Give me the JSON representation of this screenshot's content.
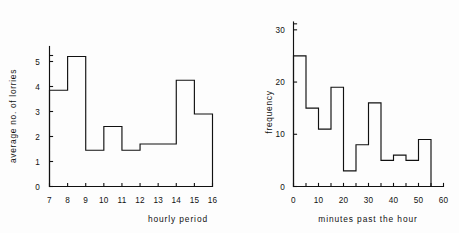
{
  "figure": {
    "background_color": "#fdfdfd",
    "ink_color": "#111111",
    "panel_count": 2
  },
  "chart_data": [
    {
      "type": "bar",
      "id": "lorries-histogram",
      "title": "",
      "xlabel": "hourly period",
      "ylabel": "average no. of lorries",
      "xlim": [
        7,
        16
      ],
      "ylim": [
        0,
        5.6
      ],
      "xticks": [
        7,
        8,
        9,
        10,
        11,
        12,
        13,
        14,
        15,
        16
      ],
      "xtick_labels": [
        "7",
        "8",
        "9",
        "10",
        "11",
        "12",
        "13",
        "14",
        "15",
        "16"
      ],
      "yticks": [
        0,
        1,
        2,
        3,
        4,
        5
      ],
      "ytick_labels": [
        "0",
        "1",
        "2",
        "3",
        "4",
        "5"
      ],
      "grid": false,
      "legend": "none",
      "bin_edges": [
        7,
        8,
        9,
        10,
        11,
        12,
        13,
        14,
        15,
        16
      ],
      "categories": [
        "7-8",
        "8-9",
        "9-10",
        "10-11",
        "11-12",
        "12-13",
        "13-14",
        "14-15",
        "15-16"
      ],
      "values": [
        3.85,
        5.2,
        1.45,
        2.4,
        1.45,
        1.7,
        1.7,
        4.25,
        2.9
      ]
    },
    {
      "type": "bar",
      "id": "minutes-histogram",
      "title": "",
      "xlabel": "minutes past the hour",
      "ylabel": "frequency",
      "xlim": [
        0,
        60
      ],
      "ylim": [
        0,
        30
      ],
      "xticks": [
        0,
        5,
        10,
        15,
        20,
        25,
        30,
        35,
        40,
        45,
        50,
        55,
        60
      ],
      "xtick_labels": [
        "0",
        "",
        "10",
        "",
        "20",
        "",
        "30",
        "",
        "40",
        "",
        "50",
        "",
        "60"
      ],
      "yticks": [
        0,
        10,
        20,
        30
      ],
      "ytick_labels": [
        "0",
        "10",
        "20",
        "30"
      ],
      "grid": false,
      "legend": "none",
      "bin_edges": [
        0,
        5,
        10,
        15,
        20,
        25,
        30,
        35,
        40,
        45,
        50,
        55
      ],
      "categories": [
        "0-5",
        "5-10",
        "10-15",
        "15-20",
        "20-25",
        "25-30",
        "30-35",
        "35-40",
        "40-45",
        "45-50",
        "50-55"
      ],
      "values": [
        25,
        15,
        11,
        19,
        3,
        8,
        16,
        5,
        6,
        5,
        9
      ]
    }
  ]
}
